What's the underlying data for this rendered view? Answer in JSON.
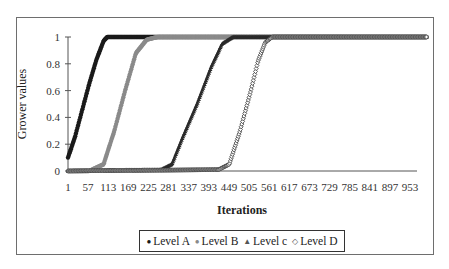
{
  "chart_data": {
    "type": "scatter",
    "title": "",
    "xlabel": "Iterations",
    "ylabel": "Grower values",
    "xlim": [
      1,
      1000
    ],
    "ylim": [
      0,
      1
    ],
    "yticks": [
      0,
      0.2,
      0.4,
      0.6,
      0.8,
      1
    ],
    "ytick_labels": [
      "0",
      "0.2",
      "0.4",
      "0.6",
      "0.8",
      "1"
    ],
    "xticks": [
      1,
      57,
      113,
      169,
      225,
      281,
      337,
      393,
      449,
      505,
      561,
      617,
      673,
      729,
      785,
      841,
      897,
      953
    ],
    "grid": false,
    "legend_position": "bottom",
    "series": [
      {
        "name": "Level A",
        "marker": "circle-filled",
        "color": "#1a1a1a",
        "x": [
          1,
          20,
          40,
          60,
          80,
          100,
          110,
          130,
          160,
          1000
        ],
        "values": [
          0.1,
          0.25,
          0.45,
          0.65,
          0.83,
          0.97,
          1.0,
          1.0,
          1.0,
          1.0
        ]
      },
      {
        "name": "Level B",
        "marker": "circle-filled",
        "color": "#8a8a8a",
        "x": [
          1,
          60,
          100,
          130,
          160,
          190,
          220,
          250,
          300,
          1000
        ],
        "values": [
          0.0,
          0.0,
          0.05,
          0.3,
          0.6,
          0.88,
          0.98,
          1.0,
          1.0,
          1.0
        ]
      },
      {
        "name": "Level c",
        "marker": "triangle",
        "color": "#2a2a2a",
        "x": [
          1,
          260,
          290,
          320,
          360,
          400,
          430,
          460,
          500,
          1000
        ],
        "values": [
          0.0,
          0.01,
          0.05,
          0.25,
          0.5,
          0.78,
          0.95,
          1.0,
          1.0,
          1.0
        ]
      },
      {
        "name": "Level D",
        "marker": "diamond-open",
        "color": "#3a3a3a",
        "x": [
          1,
          420,
          450,
          480,
          510,
          530,
          550,
          570,
          600,
          1000
        ],
        "values": [
          0.0,
          0.01,
          0.05,
          0.3,
          0.6,
          0.82,
          0.96,
          1.0,
          1.0,
          1.0
        ]
      }
    ]
  },
  "legend": {
    "items": [
      {
        "label": "Level A",
        "symbol": "●"
      },
      {
        "label": "Level B",
        "symbol": "●"
      },
      {
        "label": "Level c",
        "symbol": "▲"
      },
      {
        "label": "Level D",
        "symbol": "◇"
      }
    ]
  }
}
